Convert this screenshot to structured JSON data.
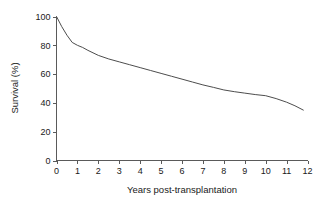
{
  "figure": {
    "background_color": "#ffffff",
    "line_color": "#4d4d4d",
    "axis_color": "#5a5a5a",
    "text_color": "#1a1a1a"
  },
  "chart_data": {
    "type": "line",
    "title": "",
    "subtitle": "",
    "xlabel": "Years post-transplantation",
    "ylabel": "Survival (%)",
    "xlim": [
      0,
      12
    ],
    "ylim": [
      0,
      100
    ],
    "xticks": [
      0,
      1,
      2,
      3,
      4,
      5,
      6,
      7,
      8,
      9,
      10,
      11,
      12
    ],
    "yticks": [
      0,
      20,
      40,
      60,
      80,
      100
    ],
    "xtick_labels": [
      "0",
      "1",
      "2",
      "3",
      "4",
      "5",
      "6",
      "7",
      "8",
      "9",
      "10",
      "11",
      "12"
    ],
    "ytick_labels": [
      "0",
      "20",
      "40",
      "60",
      "80",
      "100"
    ],
    "grid": false,
    "legend": null,
    "legend_position": "none",
    "annotations": [],
    "series": [
      {
        "name": "Survival",
        "x": [
          0,
          0.25,
          0.5,
          0.75,
          1,
          1.25,
          1.5,
          2,
          2.5,
          3,
          3.5,
          4,
          4.5,
          5,
          5.5,
          6,
          6.5,
          7,
          7.5,
          8,
          8.5,
          9,
          9.5,
          10,
          10.5,
          11,
          11.4,
          11.8
        ],
        "y": [
          100,
          93,
          87,
          82,
          80,
          78.5,
          76.5,
          73,
          70.5,
          68.5,
          66.5,
          64.5,
          62.5,
          60.5,
          58.5,
          56.5,
          54.5,
          52.5,
          50.8,
          49,
          47.8,
          46.8,
          45.8,
          45,
          43,
          40.5,
          38,
          35
        ]
      }
    ]
  }
}
